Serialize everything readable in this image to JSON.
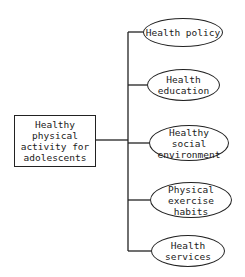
{
  "diagram": {
    "type": "tree",
    "root": {
      "label": "Healthy physical activity for adolescents",
      "lines": [
        "Healthy",
        "physical",
        "activity for",
        "adolescents"
      ]
    },
    "children": [
      {
        "label": "Health policy",
        "lines": [
          "Health policy"
        ]
      },
      {
        "label": "Health education",
        "lines": [
          "Health",
          "education"
        ]
      },
      {
        "label": "Healthy social environment",
        "lines": [
          "Healthy social",
          "environment"
        ]
      },
      {
        "label": "Physical exercise habits",
        "lines": [
          "Physical",
          "exercise habits"
        ]
      },
      {
        "label": "Health services",
        "lines": [
          "Health",
          "services"
        ]
      }
    ],
    "colors": {
      "stroke": "#222222",
      "background": "#ffffff",
      "text": "#1a1a1a"
    }
  }
}
